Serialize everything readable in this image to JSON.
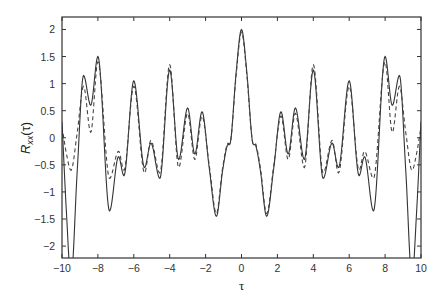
{
  "chart_data": {
    "type": "line",
    "title": "",
    "xlabel": "τ",
    "ylabel": "R_xx(τ)",
    "ylabel_main": "R",
    "ylabel_sub": "xx",
    "ylabel_arg": "(τ)",
    "xlim": [
      -10,
      10
    ],
    "ylim": [
      -2.22,
      2.23
    ],
    "grid": false,
    "legend": null,
    "x_ticks": [
      -10,
      -8,
      -6,
      -4,
      -2,
      0,
      2,
      4,
      6,
      8,
      10
    ],
    "x_tick_labels": [
      "−10",
      "−8",
      "−6",
      "−4",
      "−2",
      "0",
      "2",
      "4",
      "6",
      "8",
      "10"
    ],
    "y_ticks": [
      -2,
      -1.5,
      -1,
      -0.5,
      0,
      0.5,
      1,
      1.5,
      2
    ],
    "y_tick_labels": [
      "−2",
      "−1.5",
      "−1",
      "−0.5",
      "0",
      "0.5",
      "1",
      "1.5",
      "2"
    ],
    "symmetric_about_zero": true,
    "series": [
      {
        "name": "solid",
        "style": "solid",
        "color": "#333333",
        "tau_half": [
          0,
          0.3,
          0.6,
          0.8,
          1.05,
          1.4,
          1.8,
          2.2,
          2.6,
          3.0,
          3.5,
          4.0,
          4.55,
          5.05,
          5.4,
          6.0,
          6.55,
          6.85,
          7.35,
          8.0,
          8.4,
          8.8,
          9.15,
          9.5,
          9.75,
          10
        ],
        "values_half": [
          2.0,
          1.2,
          -0.05,
          -0.15,
          -0.6,
          -1.45,
          -0.55,
          0.48,
          -0.3,
          0.55,
          -0.4,
          1.25,
          -0.75,
          -0.1,
          -0.55,
          1.05,
          -0.7,
          -0.35,
          -1.35,
          1.5,
          0.6,
          1.15,
          -0.6,
          -2.6,
          -1.4,
          0.3
        ]
      },
      {
        "name": "dashed",
        "style": "dashed",
        "color": "#444444",
        "tau_half": [
          0,
          0.3,
          0.6,
          0.8,
          1.05,
          1.4,
          1.8,
          2.2,
          2.6,
          3.0,
          3.5,
          4.0,
          4.55,
          5.05,
          5.4,
          6.0,
          6.55,
          6.85,
          7.35,
          8.0,
          8.4,
          8.8,
          9.15,
          9.5,
          9.75,
          10
        ],
        "values_half": [
          1.95,
          1.15,
          -0.05,
          -0.12,
          -0.55,
          -1.4,
          -0.5,
          0.4,
          -0.4,
          0.45,
          -0.55,
          1.35,
          -0.65,
          -0.05,
          -0.65,
          0.95,
          -0.6,
          -0.25,
          -0.75,
          1.4,
          0.1,
          0.95,
          0.1,
          -0.6,
          -0.3,
          0.2
        ]
      }
    ]
  }
}
